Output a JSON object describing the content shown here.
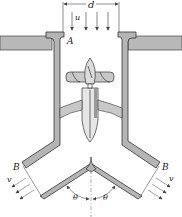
{
  "diagram": {
    "labels": {
      "diameter": "d",
      "inlet_velocity": "u",
      "inlet_section": "A",
      "outlet_section_left": "B",
      "outlet_section_right": "B",
      "outlet_velocity_left": "v",
      "outlet_velocity_right": "v",
      "angle_left": "θ",
      "angle_right": "θ"
    },
    "colors": {
      "wall_fill": "#b5b5b5",
      "stroke": "#333333",
      "background": "#ffffff"
    }
  }
}
